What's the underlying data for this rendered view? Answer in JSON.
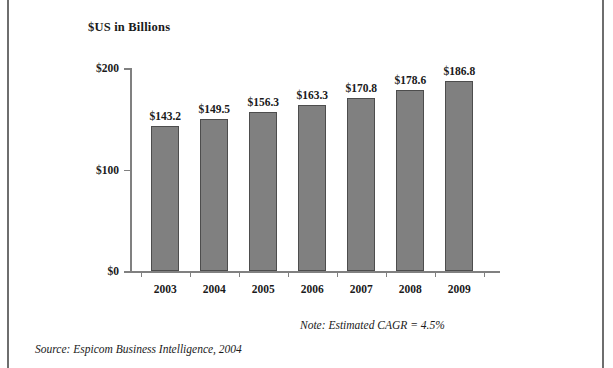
{
  "frame": {
    "border_color": "#6e6e6e"
  },
  "chart_data": {
    "type": "bar",
    "title": "$US in Billions",
    "xlabel": "",
    "ylabel": "",
    "categories": [
      "2003",
      "2004",
      "2005",
      "2006",
      "2007",
      "2008",
      "2009"
    ],
    "values": [
      143.2,
      149.5,
      156.3,
      163.3,
      170.8,
      178.6,
      186.8
    ],
    "value_labels": [
      "$143.2",
      "$149.5",
      "$156.3",
      "$163.3",
      "$170.8",
      "$178.6",
      "$186.8"
    ],
    "ylim": [
      0,
      200
    ],
    "yticks": [
      0,
      100,
      200
    ],
    "ytick_labels": [
      "$0",
      "$100",
      "$200"
    ],
    "grid": false,
    "legend": null,
    "bar_color": "#808080",
    "bar_edge_color": "#4d4d4d",
    "axis_color": "#808080"
  },
  "annotations": {
    "note": "Note: Estimated CAGR = 4.5%",
    "source": "Source: Espicom Business Intelligence, 2004"
  }
}
